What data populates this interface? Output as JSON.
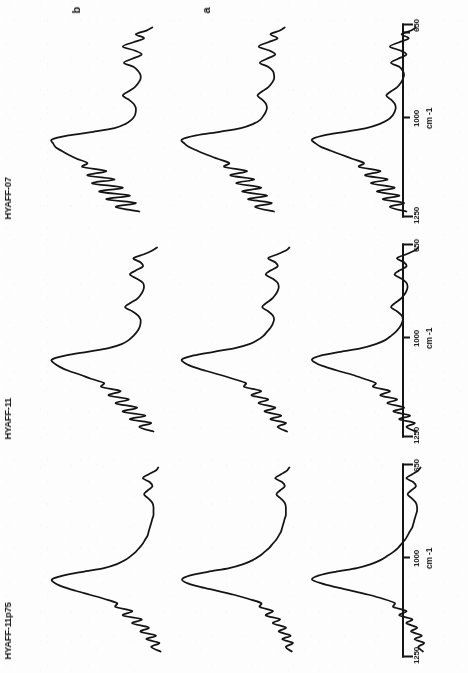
{
  "figure": {
    "kind": "ftir-spectra-plate",
    "orientation_note": "page-rotated-90",
    "ink_color": "#141414",
    "paper_color": "#fdfdfd"
  },
  "series_legend": [
    {
      "key": "a",
      "label": "a"
    },
    {
      "key": "b",
      "label": "b"
    },
    {
      "key": "c",
      "label": "c"
    }
  ],
  "axis": {
    "unit_label": "cm -1",
    "tick_labels": [
      "650",
      "1000",
      "1250"
    ],
    "tick_values": [
      650,
      1000,
      1250
    ]
  },
  "panels": [
    {
      "title": "HYAFF-11p75"
    },
    {
      "title": "HYAFF-11"
    },
    {
      "title": "HYAFF-07"
    }
  ],
  "chart_data": {
    "type": "line",
    "title": "",
    "subtitle": "",
    "xlabel": "cm -1",
    "ylabel": "",
    "xlim": [
      1250,
      650
    ],
    "x_axis_reversed": true,
    "grid": false,
    "legend_position": "top",
    "tick_labels": [
      "1250",
      "1000",
      "650"
    ],
    "tick_values": [
      1250,
      1000,
      650
    ],
    "panel_titles": [
      "HYAFF-11p75",
      "HYAFF-11",
      "HYAFF-07"
    ],
    "series_names": [
      "a",
      "b",
      "c"
    ],
    "panels": [
      {
        "title": "HYAFF-11p75",
        "series": [
          {
            "name": "a",
            "x": [
              1250,
              1235,
              1222,
              1210,
              1198,
              1185,
              1172,
              1158,
              1145,
              1132,
              1118,
              1105,
              1092,
              1078,
              1065,
              1052,
              1040,
              1028,
              1015,
              1002,
              990,
              978,
              965,
              952,
              938,
              925,
              912,
              898,
              885,
              872,
              858,
              845,
              832,
              818,
              805,
              792,
              778,
              765,
              752,
              738,
              725,
              712,
              698,
              685,
              672,
              660,
              650
            ],
            "y": [
              0.06,
              0.1,
              0.05,
              0.13,
              0.07,
              0.16,
              0.11,
              0.2,
              0.15,
              0.26,
              0.2,
              0.31,
              0.3,
              0.4,
              0.52,
              0.66,
              0.8,
              0.92,
              1.0,
              0.94,
              0.8,
              0.62,
              0.5,
              0.42,
              0.36,
              0.31,
              0.27,
              0.24,
              0.21,
              0.19,
              0.17,
              0.15,
              0.14,
              0.13,
              0.12,
              0.11,
              0.11,
              0.12,
              0.15,
              0.19,
              0.16,
              0.12,
              0.14,
              0.2,
              0.15,
              0.1,
              0.08
            ]
          },
          {
            "name": "b",
            "x": [
              1250,
              1235,
              1222,
              1210,
              1198,
              1185,
              1172,
              1158,
              1145,
              1132,
              1118,
              1105,
              1092,
              1078,
              1065,
              1052,
              1040,
              1028,
              1015,
              1002,
              990,
              978,
              965,
              952,
              938,
              925,
              912,
              898,
              885,
              872,
              858,
              845,
              832,
              818,
              805,
              792,
              778,
              765,
              752,
              738,
              725,
              712,
              698,
              685,
              672,
              660,
              650
            ],
            "y": [
              0.07,
              0.12,
              0.06,
              0.15,
              0.08,
              0.18,
              0.12,
              0.23,
              0.17,
              0.29,
              0.23,
              0.34,
              0.33,
              0.44,
              0.56,
              0.7,
              0.84,
              0.95,
              1.0,
              0.93,
              0.78,
              0.6,
              0.48,
              0.4,
              0.34,
              0.3,
              0.26,
              0.23,
              0.2,
              0.18,
              0.16,
              0.15,
              0.14,
              0.13,
              0.12,
              0.12,
              0.12,
              0.13,
              0.16,
              0.2,
              0.17,
              0.13,
              0.15,
              0.21,
              0.16,
              0.11,
              0.09
            ]
          },
          {
            "name": "c",
            "x": [
              1250,
              1235,
              1222,
              1210,
              1198,
              1185,
              1172,
              1158,
              1145,
              1132,
              1118,
              1105,
              1092,
              1078,
              1065,
              1052,
              1040,
              1028,
              1015,
              1002,
              990,
              978,
              965,
              952,
              938,
              925,
              912,
              898,
              885,
              872,
              858,
              845,
              832,
              818,
              805,
              792,
              778,
              765,
              752,
              738,
              725,
              712,
              698,
              685,
              672,
              660,
              650
            ],
            "y": [
              0.08,
              0.16,
              0.09,
              0.2,
              0.12,
              0.25,
              0.18,
              0.32,
              0.24,
              0.4,
              0.32,
              0.46,
              0.45,
              0.56,
              0.68,
              0.8,
              0.9,
              0.97,
              1.0,
              0.9,
              0.74,
              0.56,
              0.45,
              0.38,
              0.33,
              0.29,
              0.26,
              0.23,
              0.21,
              0.19,
              0.18,
              0.17,
              0.16,
              0.15,
              0.14,
              0.14,
              0.14,
              0.15,
              0.18,
              0.22,
              0.19,
              0.15,
              0.17,
              0.23,
              0.18,
              0.12,
              0.1
            ]
          }
        ]
      },
      {
        "title": "HYAFF-11",
        "series": [
          {
            "name": "a",
            "x": [
              1250,
              1235,
              1222,
              1210,
              1198,
              1185,
              1172,
              1158,
              1145,
              1132,
              1118,
              1105,
              1092,
              1078,
              1065,
              1052,
              1040,
              1028,
              1015,
              1002,
              990,
              978,
              965,
              952,
              938,
              925,
              912,
              898,
              885,
              872,
              858,
              845,
              832,
              818,
              805,
              792,
              778,
              765,
              752,
              738,
              725,
              712,
              698,
              685,
              672,
              660,
              650
            ],
            "y": [
              0.12,
              0.2,
              0.13,
              0.26,
              0.17,
              0.31,
              0.22,
              0.36,
              0.28,
              0.42,
              0.34,
              0.48,
              0.46,
              0.56,
              0.66,
              0.78,
              0.88,
              0.96,
              1.0,
              0.92,
              0.76,
              0.58,
              0.46,
              0.38,
              0.33,
              0.29,
              0.26,
              0.24,
              0.23,
              0.24,
              0.28,
              0.33,
              0.3,
              0.25,
              0.22,
              0.2,
              0.19,
              0.2,
              0.24,
              0.3,
              0.26,
              0.2,
              0.22,
              0.28,
              0.2,
              0.13,
              0.1
            ]
          },
          {
            "name": "b",
            "x": [
              1250,
              1235,
              1222,
              1210,
              1198,
              1185,
              1172,
              1158,
              1145,
              1132,
              1118,
              1105,
              1092,
              1078,
              1065,
              1052,
              1040,
              1028,
              1015,
              1002,
              990,
              978,
              965,
              952,
              938,
              925,
              912,
              898,
              885,
              872,
              858,
              845,
              832,
              818,
              805,
              792,
              778,
              765,
              752,
              738,
              725,
              712,
              698,
              685,
              672,
              660,
              650
            ],
            "y": [
              0.11,
              0.19,
              0.12,
              0.25,
              0.16,
              0.3,
              0.21,
              0.35,
              0.27,
              0.41,
              0.33,
              0.47,
              0.46,
              0.57,
              0.68,
              0.8,
              0.9,
              0.97,
              1.0,
              0.9,
              0.73,
              0.55,
              0.43,
              0.36,
              0.31,
              0.28,
              0.25,
              0.23,
              0.22,
              0.23,
              0.27,
              0.32,
              0.29,
              0.24,
              0.21,
              0.19,
              0.18,
              0.19,
              0.23,
              0.29,
              0.25,
              0.19,
              0.21,
              0.27,
              0.19,
              0.12,
              0.09
            ]
          },
          {
            "name": "c",
            "x": [
              1250,
              1235,
              1222,
              1210,
              1198,
              1185,
              1172,
              1158,
              1145,
              1132,
              1118,
              1105,
              1092,
              1078,
              1065,
              1052,
              1040,
              1028,
              1015,
              1002,
              990,
              978,
              965,
              952,
              938,
              925,
              912,
              898,
              885,
              872,
              858,
              845,
              832,
              818,
              805,
              792,
              778,
              765,
              752,
              738,
              725,
              712,
              698,
              685,
              672,
              660,
              650
            ],
            "y": [
              0.14,
              0.26,
              0.16,
              0.34,
              0.21,
              0.4,
              0.28,
              0.46,
              0.35,
              0.52,
              0.42,
              0.58,
              0.56,
              0.67,
              0.76,
              0.86,
              0.93,
              0.98,
              1.0,
              0.88,
              0.7,
              0.52,
              0.41,
              0.35,
              0.31,
              0.28,
              0.26,
              0.25,
              0.25,
              0.27,
              0.32,
              0.38,
              0.34,
              0.28,
              0.25,
              0.23,
              0.22,
              0.23,
              0.28,
              0.34,
              0.29,
              0.23,
              0.25,
              0.31,
              0.22,
              0.15,
              0.11
            ]
          }
        ]
      },
      {
        "title": "HYAFF-07",
        "series": [
          {
            "name": "a",
            "x": [
              1250,
              1235,
              1222,
              1210,
              1198,
              1185,
              1172,
              1158,
              1145,
              1132,
              1118,
              1105,
              1092,
              1078,
              1065,
              1052,
              1040,
              1028,
              1015,
              1002,
              990,
              978,
              965,
              952,
              938,
              925,
              912,
              898,
              885,
              872,
              858,
              845,
              832,
              818,
              805,
              792,
              778,
              765,
              752,
              738,
              725,
              712,
              698,
              685,
              672,
              660,
              650
            ],
            "y": [
              0.2,
              0.34,
              0.22,
              0.4,
              0.26,
              0.45,
              0.3,
              0.5,
              0.36,
              0.55,
              0.42,
              0.6,
              0.56,
              0.66,
              0.75,
              0.84,
              0.92,
              0.97,
              1.0,
              0.9,
              0.72,
              0.54,
              0.43,
              0.36,
              0.32,
              0.3,
              0.29,
              0.3,
              0.33,
              0.37,
              0.33,
              0.28,
              0.25,
              0.23,
              0.22,
              0.23,
              0.26,
              0.33,
              0.27,
              0.2,
              0.25,
              0.34,
              0.26,
              0.18,
              0.24,
              0.16,
              0.12
            ]
          },
          {
            "name": "b",
            "x": [
              1250,
              1235,
              1222,
              1210,
              1198,
              1185,
              1172,
              1158,
              1145,
              1132,
              1118,
              1105,
              1092,
              1078,
              1065,
              1052,
              1040,
              1028,
              1015,
              1002,
              990,
              978,
              965,
              952,
              938,
              925,
              912,
              898,
              885,
              872,
              858,
              845,
              832,
              818,
              805,
              792,
              778,
              765,
              752,
              738,
              725,
              712,
              698,
              685,
              672,
              660,
              650
            ],
            "y": [
              0.22,
              0.38,
              0.24,
              0.44,
              0.28,
              0.49,
              0.33,
              0.54,
              0.39,
              0.59,
              0.45,
              0.64,
              0.6,
              0.7,
              0.79,
              0.87,
              0.94,
              0.98,
              1.0,
              0.88,
              0.68,
              0.5,
              0.4,
              0.34,
              0.31,
              0.29,
              0.28,
              0.29,
              0.32,
              0.36,
              0.32,
              0.27,
              0.24,
              0.22,
              0.22,
              0.23,
              0.27,
              0.34,
              0.28,
              0.21,
              0.26,
              0.35,
              0.27,
              0.19,
              0.25,
              0.17,
              0.13
            ]
          },
          {
            "name": "c",
            "x": [
              1250,
              1235,
              1222,
              1210,
              1198,
              1185,
              1172,
              1158,
              1145,
              1132,
              1118,
              1105,
              1092,
              1078,
              1065,
              1052,
              1040,
              1028,
              1015,
              1002,
              990,
              978,
              965,
              952,
              938,
              925,
              912,
              898,
              885,
              872,
              858,
              845,
              832,
              818,
              805,
              792,
              778,
              765,
              752,
              738,
              725,
              712,
              698,
              685,
              672,
              660,
              650
            ],
            "y": [
              0.26,
              0.46,
              0.29,
              0.54,
              0.34,
              0.6,
              0.4,
              0.66,
              0.47,
              0.7,
              0.54,
              0.74,
              0.7,
              0.79,
              0.86,
              0.92,
              0.97,
              0.99,
              1.0,
              0.86,
              0.65,
              0.47,
              0.38,
              0.33,
              0.3,
              0.29,
              0.29,
              0.31,
              0.35,
              0.4,
              0.35,
              0.3,
              0.27,
              0.25,
              0.25,
              0.27,
              0.31,
              0.39,
              0.32,
              0.24,
              0.3,
              0.4,
              0.31,
              0.22,
              0.29,
              0.2,
              0.15
            ]
          }
        ]
      }
    ]
  }
}
